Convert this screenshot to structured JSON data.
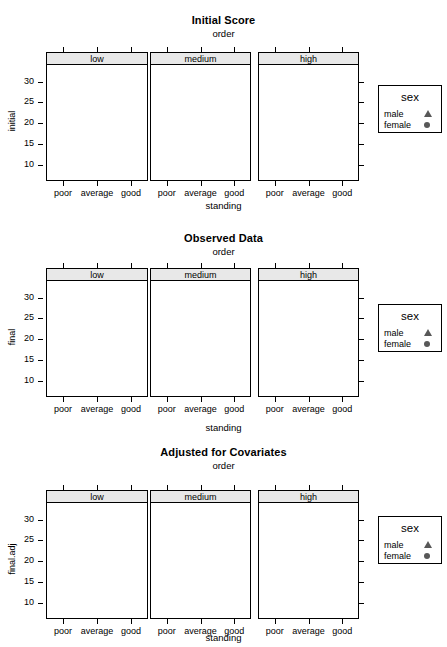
{
  "figures": [
    {
      "title": "Initial Score",
      "subtitle": "order",
      "ylabel": "initial",
      "xlabel": "standing"
    },
    {
      "title": "Observed Data",
      "subtitle": "order",
      "ylabel": "final",
      "xlabel": "standing"
    },
    {
      "title": "Adjusted for Covariates",
      "subtitle": "order",
      "ylabel": "final.adj",
      "xlabel": "standing"
    }
  ],
  "legend": {
    "title": "sex",
    "entries": [
      {
        "label": "male",
        "marker": "triangle-up-icon"
      },
      {
        "label": "female",
        "marker": "circle-icon"
      }
    ]
  },
  "strips": [
    "low",
    "medium",
    "high"
  ],
  "x_categories": [
    "poor",
    "average",
    "good"
  ],
  "y_ticks": [
    10,
    15,
    20,
    25,
    30
  ],
  "colors": {
    "point": "#585858",
    "strip_background": "#e8e8e8",
    "axis": "#000000",
    "background": "#ffffff"
  },
  "chart_data": [
    {
      "type": "scatter",
      "title": "Initial Score",
      "subtitle": "order",
      "xlabel": "standing",
      "ylabel": "initial",
      "ylim": [
        6,
        34
      ],
      "grid": false,
      "legend_position": "right",
      "conditioning_variable": "order",
      "panels": [
        "low",
        "medium",
        "high"
      ],
      "categories": [
        "poor",
        "average",
        "good"
      ],
      "series": [
        {
          "name": "male",
          "marker": "triangle-up-icon",
          "points": [
            {
              "panel": "low",
              "x": "poor",
              "y": 12.3
            },
            {
              "panel": "low",
              "x": "poor",
              "y": 9.6
            },
            {
              "panel": "low",
              "x": "poor",
              "y": 9.2
            },
            {
              "panel": "low",
              "x": "average",
              "y": 14.2
            },
            {
              "panel": "low",
              "x": "average",
              "y": 13.6
            },
            {
              "panel": "low",
              "x": "average",
              "y": 14.9
            },
            {
              "panel": "low",
              "x": "good",
              "y": 22.1
            },
            {
              "panel": "low",
              "x": "good",
              "y": 21.4
            },
            {
              "panel": "low",
              "x": "good",
              "y": 19.5
            },
            {
              "panel": "medium",
              "x": "poor",
              "y": 15.0
            },
            {
              "panel": "medium",
              "x": "poor",
              "y": 14.3
            },
            {
              "panel": "medium",
              "x": "poor",
              "y": 13.3
            },
            {
              "panel": "medium",
              "x": "average",
              "y": 17.9
            },
            {
              "panel": "medium",
              "x": "average",
              "y": 14.4
            },
            {
              "panel": "medium",
              "x": "good",
              "y": 24.7
            },
            {
              "panel": "medium",
              "x": "good",
              "y": 22.0
            },
            {
              "panel": "medium",
              "x": "good",
              "y": 21.6
            },
            {
              "panel": "high",
              "x": "poor",
              "y": 17.8
            },
            {
              "panel": "high",
              "x": "poor",
              "y": 17.1
            },
            {
              "panel": "high",
              "x": "average",
              "y": 25.6
            },
            {
              "panel": "high",
              "x": "average",
              "y": 22.3
            },
            {
              "panel": "high",
              "x": "average",
              "y": 21.5
            },
            {
              "panel": "high",
              "x": "good",
              "y": 29.4
            },
            {
              "panel": "high",
              "x": "good",
              "y": 28.7
            },
            {
              "panel": "high",
              "x": "good",
              "y": 25.0
            },
            {
              "panel": "high",
              "x": "good",
              "y": 22.5
            }
          ]
        },
        {
          "name": "female",
          "marker": "circle-icon",
          "points": [
            {
              "panel": "low",
              "x": "poor",
              "y": 12.1
            },
            {
              "panel": "low",
              "x": "poor",
              "y": 9.5
            },
            {
              "panel": "low",
              "x": "poor",
              "y": 7.4
            },
            {
              "panel": "low",
              "x": "average",
              "y": 17.0
            },
            {
              "panel": "low",
              "x": "average",
              "y": 16.1
            },
            {
              "panel": "low",
              "x": "average",
              "y": 13.5
            },
            {
              "panel": "low",
              "x": "good",
              "y": 20.1
            },
            {
              "panel": "low",
              "x": "good",
              "y": 17.2
            },
            {
              "panel": "medium",
              "x": "poor",
              "y": 13.5
            },
            {
              "panel": "medium",
              "x": "poor",
              "y": 12.3
            },
            {
              "panel": "medium",
              "x": "poor",
              "y": 7.2
            },
            {
              "panel": "medium",
              "x": "average",
              "y": 19.2
            },
            {
              "panel": "medium",
              "x": "average",
              "y": 18.4
            },
            {
              "panel": "medium",
              "x": "average",
              "y": 16.8
            },
            {
              "panel": "medium",
              "x": "good",
              "y": 29.5
            },
            {
              "panel": "medium",
              "x": "good",
              "y": 22.3
            },
            {
              "panel": "high",
              "x": "poor",
              "y": 17.4
            },
            {
              "panel": "high",
              "x": "poor",
              "y": 13.5
            },
            {
              "panel": "high",
              "x": "poor",
              "y": 9.5
            },
            {
              "panel": "high",
              "x": "average",
              "y": 19.5
            },
            {
              "panel": "high",
              "x": "average",
              "y": 18.4
            },
            {
              "panel": "high",
              "x": "good",
              "y": 16.6
            }
          ]
        }
      ]
    },
    {
      "type": "scatter",
      "title": "Observed Data",
      "subtitle": "order",
      "xlabel": "standing",
      "ylabel": "final",
      "ylim": [
        6,
        34
      ],
      "grid": false,
      "legend_position": "right",
      "conditioning_variable": "order",
      "panels": [
        "low",
        "medium",
        "high"
      ],
      "categories": [
        "poor",
        "average",
        "good"
      ],
      "series": [
        {
          "name": "male",
          "marker": "triangle-up-icon",
          "points": [
            {
              "panel": "low",
              "x": "poor",
              "y": 14.0
            },
            {
              "panel": "low",
              "x": "poor",
              "y": 13.2
            },
            {
              "panel": "low",
              "x": "poor",
              "y": 12.6
            },
            {
              "panel": "low",
              "x": "average",
              "y": 19.3
            },
            {
              "panel": "low",
              "x": "average",
              "y": 16.3
            },
            {
              "panel": "low",
              "x": "average",
              "y": 14.2
            },
            {
              "panel": "low",
              "x": "good",
              "y": 25.2
            },
            {
              "panel": "low",
              "x": "good",
              "y": 24.0
            },
            {
              "panel": "low",
              "x": "good",
              "y": 22.4
            },
            {
              "panel": "medium",
              "x": "poor",
              "y": 16.8
            },
            {
              "panel": "medium",
              "x": "poor",
              "y": 16.0
            },
            {
              "panel": "medium",
              "x": "poor",
              "y": 15.3
            },
            {
              "panel": "medium",
              "x": "average",
              "y": 22.9
            },
            {
              "panel": "medium",
              "x": "average",
              "y": 21.0
            },
            {
              "panel": "medium",
              "x": "average",
              "y": 18.3
            },
            {
              "panel": "medium",
              "x": "good",
              "y": 29.6
            },
            {
              "panel": "medium",
              "x": "good",
              "y": 29.3
            },
            {
              "panel": "medium",
              "x": "good",
              "y": 26.3
            },
            {
              "panel": "high",
              "x": "poor",
              "y": 18.7
            },
            {
              "panel": "high",
              "x": "poor",
              "y": 18.1
            },
            {
              "panel": "high",
              "x": "poor",
              "y": 17.5
            },
            {
              "panel": "high",
              "x": "average",
              "y": 26.4
            },
            {
              "panel": "high",
              "x": "average",
              "y": 24.0
            },
            {
              "panel": "high",
              "x": "average",
              "y": 23.1
            },
            {
              "panel": "high",
              "x": "good",
              "y": 30.1
            },
            {
              "panel": "high",
              "x": "good",
              "y": 29.6
            },
            {
              "panel": "high",
              "x": "good",
              "y": 26.7
            }
          ]
        },
        {
          "name": "female",
          "marker": "circle-icon",
          "points": [
            {
              "panel": "low",
              "x": "poor",
              "y": 12.7
            },
            {
              "panel": "low",
              "x": "poor",
              "y": 9.8
            },
            {
              "panel": "low",
              "x": "poor",
              "y": 9.3
            },
            {
              "panel": "low",
              "x": "average",
              "y": 17.1
            },
            {
              "panel": "low",
              "x": "average",
              "y": 15.8
            },
            {
              "panel": "low",
              "x": "average",
              "y": 14.0
            },
            {
              "panel": "low",
              "x": "good",
              "y": 23.2
            },
            {
              "panel": "low",
              "x": "good",
              "y": 22.2
            },
            {
              "panel": "low",
              "x": "good",
              "y": 19.2
            },
            {
              "panel": "medium",
              "x": "poor",
              "y": 15.7
            },
            {
              "panel": "medium",
              "x": "poor",
              "y": 15.2
            },
            {
              "panel": "medium",
              "x": "poor",
              "y": 12.2
            },
            {
              "panel": "medium",
              "x": "average",
              "y": 20.6
            },
            {
              "panel": "medium",
              "x": "average",
              "y": 18.2
            },
            {
              "panel": "medium",
              "x": "good",
              "y": 26.0
            },
            {
              "panel": "medium",
              "x": "good",
              "y": 21.3
            },
            {
              "panel": "high",
              "x": "poor",
              "y": 18.3
            },
            {
              "panel": "high",
              "x": "poor",
              "y": 15.0
            },
            {
              "panel": "high",
              "x": "poor",
              "y": 14.4
            },
            {
              "panel": "high",
              "x": "average",
              "y": 23.3
            },
            {
              "panel": "high",
              "x": "average",
              "y": 20.4
            },
            {
              "panel": "high",
              "x": "good",
              "y": 33.5
            },
            {
              "panel": "high",
              "x": "good",
              "y": 29.8
            },
            {
              "panel": "high",
              "x": "good",
              "y": 26.6
            },
            {
              "panel": "high",
              "x": "good",
              "y": 21.4
            }
          ]
        }
      ]
    },
    {
      "type": "scatter",
      "title": "Adjusted for Covariates",
      "subtitle": "order",
      "xlabel": "standing",
      "ylabel": "final.adj",
      "ylim": [
        6,
        34
      ],
      "grid": false,
      "legend_position": "right",
      "conditioning_variable": "order",
      "panels": [
        "low",
        "medium",
        "high"
      ],
      "categories": [
        "poor",
        "average",
        "good"
      ],
      "series": [
        {
          "name": "male",
          "marker": "triangle-up-icon",
          "points": [
            {
              "panel": "low",
              "x": "poor",
              "y": 19.8
            },
            {
              "panel": "low",
              "x": "poor",
              "y": 19.2
            },
            {
              "panel": "low",
              "x": "poor",
              "y": 18.4
            },
            {
              "panel": "low",
              "x": "average",
              "y": 19.7
            },
            {
              "panel": "low",
              "x": "average",
              "y": 18.4
            },
            {
              "panel": "low",
              "x": "average",
              "y": 17.9
            },
            {
              "panel": "low",
              "x": "good",
              "y": 21.2
            },
            {
              "panel": "low",
              "x": "good",
              "y": 20.6
            },
            {
              "panel": "low",
              "x": "good",
              "y": 20.3
            },
            {
              "panel": "medium",
              "x": "poor",
              "y": 21.7
            },
            {
              "panel": "medium",
              "x": "poor",
              "y": 20.6
            },
            {
              "panel": "medium",
              "x": "poor",
              "y": 17.8
            },
            {
              "panel": "medium",
              "x": "average",
              "y": 21.5
            },
            {
              "panel": "medium",
              "x": "average",
              "y": 20.8
            },
            {
              "panel": "medium",
              "x": "average",
              "y": 20.2
            },
            {
              "panel": "medium",
              "x": "good",
              "y": 22.2
            },
            {
              "panel": "medium",
              "x": "good",
              "y": 21.2
            },
            {
              "panel": "high",
              "x": "poor",
              "y": 19.4
            },
            {
              "panel": "high",
              "x": "poor",
              "y": 18.6
            },
            {
              "panel": "high",
              "x": "average",
              "y": 21.1
            },
            {
              "panel": "high",
              "x": "average",
              "y": 20.2
            },
            {
              "panel": "high",
              "x": "average",
              "y": 17.2
            },
            {
              "panel": "high",
              "x": "good",
              "y": 22.4
            },
            {
              "panel": "high",
              "x": "good",
              "y": 21.8
            }
          ]
        },
        {
          "name": "female",
          "marker": "circle-icon",
          "points": [
            {
              "panel": "low",
              "x": "poor",
              "y": 19.6
            },
            {
              "panel": "low",
              "x": "poor",
              "y": 19.0
            },
            {
              "panel": "low",
              "x": "average",
              "y": 18.8
            },
            {
              "panel": "low",
              "x": "average",
              "y": 18.1
            },
            {
              "panel": "low",
              "x": "good",
              "y": 20.9
            },
            {
              "panel": "low",
              "x": "good",
              "y": 20.4
            },
            {
              "panel": "medium",
              "x": "poor",
              "y": 22.0
            },
            {
              "panel": "medium",
              "x": "poor",
              "y": 20.4
            },
            {
              "panel": "medium",
              "x": "poor",
              "y": 17.6
            },
            {
              "panel": "medium",
              "x": "average",
              "y": 20.9
            },
            {
              "panel": "medium",
              "x": "average",
              "y": 16.5
            },
            {
              "panel": "medium",
              "x": "good",
              "y": 21.0
            },
            {
              "panel": "medium",
              "x": "good",
              "y": 17.6
            },
            {
              "panel": "high",
              "x": "poor",
              "y": 22.9
            },
            {
              "panel": "high",
              "x": "poor",
              "y": 19.3
            },
            {
              "panel": "high",
              "x": "average",
              "y": 20.4
            },
            {
              "panel": "high",
              "x": "average",
              "y": 19.8
            },
            {
              "panel": "high",
              "x": "good",
              "y": 22.2
            }
          ]
        }
      ]
    }
  ]
}
